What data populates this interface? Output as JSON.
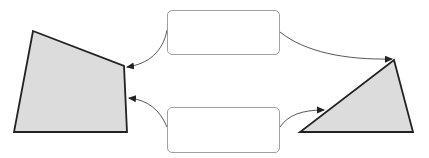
{
  "diagram": {
    "colors": {
      "shape_fill": "#dcdcdc",
      "shape_stroke": "#222222",
      "box_border": "#a0a0a0",
      "arrow": "#444444",
      "background": "#ffffff"
    },
    "shapes": [
      {
        "id": "left-quadrilateral",
        "type": "quadrilateral",
        "points": [
          [
            33,
            31
          ],
          [
            124,
            66
          ],
          [
            127,
            132
          ],
          [
            14,
            132
          ]
        ]
      },
      {
        "id": "right-triangle",
        "type": "triangle",
        "points": [
          [
            394,
            60
          ],
          [
            413,
            132
          ],
          [
            300,
            132
          ]
        ]
      }
    ],
    "boxes": [
      {
        "id": "top-box",
        "label": "",
        "x": 167,
        "y": 10,
        "width": 113,
        "height": 45
      },
      {
        "id": "bottom-box",
        "label": "",
        "x": 167,
        "y": 107,
        "width": 113,
        "height": 46
      }
    ],
    "arrows": [
      {
        "id": "top-box-to-quad",
        "from": "top-box",
        "to": "left-quadrilateral"
      },
      {
        "id": "bottom-box-to-quad",
        "from": "bottom-box",
        "to": "left-quadrilateral"
      },
      {
        "id": "top-box-to-triangle",
        "from": "top-box",
        "to": "right-triangle"
      },
      {
        "id": "bottom-box-to-triangle",
        "from": "bottom-box",
        "to": "right-triangle"
      }
    ]
  }
}
